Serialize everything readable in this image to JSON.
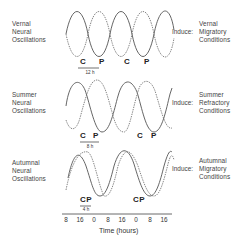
{
  "rows": [
    {
      "season_label": [
        "Vernal",
        "Neural",
        "Oscillations"
      ],
      "induce_label": "Induce:",
      "result_label": [
        "Vernal",
        "Migratory",
        "Conditions"
      ],
      "markers": [
        "C",
        "P",
        "C",
        "P"
      ],
      "phase_interval": "12 h",
      "phase_interval_hours": 12
    },
    {
      "season_label": [
        "Summer",
        "Neural",
        "Oscillations"
      ],
      "induce_label": "Induce:",
      "result_label": [
        "Summer",
        "Refractory",
        "Conditions"
      ],
      "markers": [
        "C",
        "P",
        "C",
        "P"
      ],
      "phase_interval": "8 h",
      "phase_interval_hours": 8
    },
    {
      "season_label": [
        "Autumnal",
        "Neural",
        "Oscillations"
      ],
      "induce_label": "Induce:",
      "result_label": [
        "Autumnal",
        "Migratory",
        "Conditions"
      ],
      "markers": [
        "CP",
        "CP"
      ],
      "phase_interval": "4 h",
      "phase_interval_hours": 4
    }
  ],
  "axis": {
    "ticks": [
      "8",
      "16",
      "0",
      "8",
      "16",
      "0",
      "8",
      "16"
    ],
    "title": "Time (hours)"
  },
  "legend": {
    "C": "solid curve",
    "P": "dashed curve"
  }
}
